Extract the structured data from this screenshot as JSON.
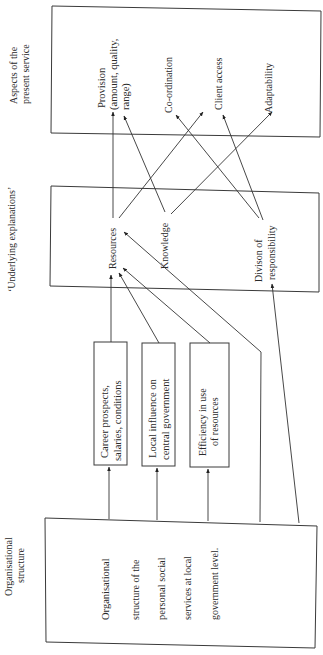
{
  "diagram": {
    "orientation": "rotated-90-ccw",
    "row_labels": {
      "aspects": [
        "Aspects of the",
        "present service"
      ],
      "explanations": "‘Underlying explanations’",
      "organisational": [
        "Organisational",
        "structure"
      ]
    },
    "aspects_box": {
      "items": {
        "provision": [
          "Provision",
          "(amount, quality,",
          "range)"
        ],
        "coordination": "Co-ordination",
        "client_access": "Client access",
        "adaptability": "Adaptability"
      }
    },
    "explanations_box": {
      "items": {
        "resources": "Resources",
        "knowledge": "Knowledge",
        "division": [
          "Divison of",
          "responsibility"
        ]
      }
    },
    "intermediate_boxes": {
      "career": [
        "Career prospects,",
        "salaries, conditions"
      ],
      "local": [
        "Local influence on",
        "central government"
      ],
      "efficiency": [
        "Efficiency in use",
        "of resources"
      ]
    },
    "organisational_box": {
      "lines": [
        "Organisational",
        "structure of the",
        "personal social",
        "services at local",
        "government level."
      ]
    },
    "edges": [
      [
        "Career prospects",
        "Resources"
      ],
      [
        "Local influence",
        "Resources"
      ],
      [
        "Efficiency in use of resources",
        "Resources"
      ],
      [
        "Organisational structure",
        "Career prospects"
      ],
      [
        "Organisational structure",
        "Local influence"
      ],
      [
        "Organisational structure",
        "Efficiency in use of resources"
      ],
      [
        "Organisational structure",
        "Knowledge"
      ],
      [
        "Organisational structure",
        "Divison of responsibility"
      ],
      [
        "Resources",
        "Provision"
      ],
      [
        "Resources",
        "Co-ordination"
      ],
      [
        "Knowledge",
        "Provision"
      ],
      [
        "Knowledge",
        "Adaptability"
      ],
      [
        "Divison of responsibility",
        "Co-ordination"
      ],
      [
        "Divison of responsibility",
        "Client access"
      ]
    ]
  }
}
